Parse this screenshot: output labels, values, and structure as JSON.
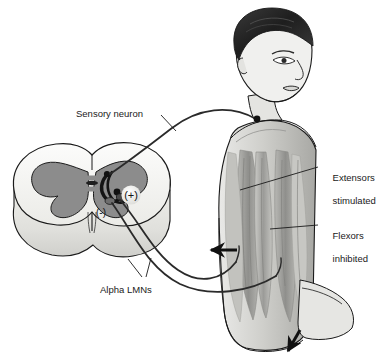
{
  "figure": {
    "type": "anatomical-diagram",
    "background_color": "#ffffff",
    "ink_color": "#1a1a1a"
  },
  "labels": {
    "sensory_neuron": "Sensory neuron",
    "alpha_lmns": "Alpha LMNs",
    "extensors_line1": "Extensors",
    "extensors_line2": "stimulated",
    "flexors_line1": "Flexors",
    "flexors_inhibited_line2": "inhibited"
  },
  "symbols": {
    "excitatory": "(+)",
    "inhibitory": "(-)"
  },
  "structures": {
    "spinal_cord": "spinal-cord-cross-section",
    "gray_matter": "butterfly-gray-matter",
    "white_matter": "white-matter",
    "human_figure": "male-torso-posterior-oblique",
    "extensor_muscles": "back-extensor-muscle-group",
    "flexor_muscles": "arm-flexor-muscle-group",
    "stimulus_site": "shoulder-sensory-receptor-dot"
  },
  "arrows": {
    "movement_arrow": "arrow-pointing-left",
    "limb_arrow": "arrow-pointing-down-left"
  },
  "colors": {
    "gray_matter": "#8c8c8c",
    "white_matter": "#f2f2f0",
    "cord_side": "#e2e2de",
    "skin_light": "#f0f0ee",
    "skin_mid": "#cfcfcb",
    "muscle_dark": "#9a9a97",
    "hair": "#2b2b2b",
    "outline": "#1a1a1a"
  }
}
